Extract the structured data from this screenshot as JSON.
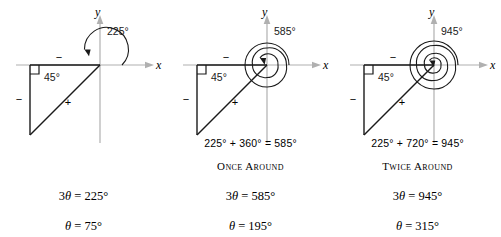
{
  "figure": {
    "panels": [
      {
        "id": "panel-225",
        "angle_label": "225°",
        "reference_angle_label": "45°",
        "x_axis_label": "x",
        "y_axis_label": "y",
        "sign_horizontal": "−",
        "sign_vertical": "−",
        "sign_hypotenuse": "+",
        "sum_line": "",
        "around_label": "",
        "equations": [
          {
            "coefficient": "3",
            "variable": "θ",
            "operator": "=",
            "value": "225°"
          },
          {
            "coefficient": "",
            "variable": "θ",
            "operator": "=",
            "value": "75°"
          }
        ],
        "revolutions": 0,
        "total_degrees": 225
      },
      {
        "id": "panel-585",
        "angle_label": "585°",
        "reference_angle_label": "45°",
        "x_axis_label": "x",
        "y_axis_label": "y",
        "sign_horizontal": "−",
        "sign_vertical": "−",
        "sign_hypotenuse": "+",
        "sum_line": "225° + 360° = 585°",
        "around_label": "Once Around",
        "equations": [
          {
            "coefficient": "3",
            "variable": "θ",
            "operator": "=",
            "value": "585°"
          },
          {
            "coefficient": "",
            "variable": "θ",
            "operator": "=",
            "value": "195°"
          }
        ],
        "revolutions": 1,
        "total_degrees": 585
      },
      {
        "id": "panel-945",
        "angle_label": "945°",
        "reference_angle_label": "45°",
        "x_axis_label": "x",
        "y_axis_label": "y",
        "sign_horizontal": "−",
        "sign_vertical": "−",
        "sign_hypotenuse": "+",
        "sum_line": "225° + 720° = 945°",
        "around_label": "Twice Around",
        "equations": [
          {
            "coefficient": "3",
            "variable": "θ",
            "operator": "=",
            "value": "945°"
          },
          {
            "coefficient": "",
            "variable": "θ",
            "operator": "=",
            "value": "315°"
          }
        ],
        "revolutions": 2,
        "total_degrees": 945
      }
    ],
    "colors": {
      "axis": "#b0b0b0",
      "triangle": "#1a1a1a",
      "arc": "#1a1a1a",
      "text": "#000000",
      "background": "#ffffff"
    }
  }
}
